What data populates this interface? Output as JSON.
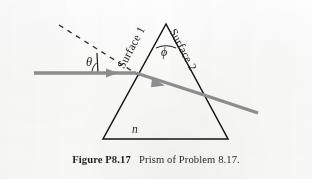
{
  "figure": {
    "caption_number": "Figure P8.17",
    "caption_text": "Prism of Problem 8.17.",
    "labels": {
      "surface_1": "Surface 1",
      "surface_2": "Surface 2",
      "incidence_angle": "θ",
      "apex_angle": "ϕ",
      "refractive_index": "n"
    },
    "colors": {
      "ray": "#8c8c8c",
      "outline": "#111111",
      "background": "#fbfbfa",
      "text": "#1b1b1b"
    },
    "geometry": {
      "apex": [
        166,
        24
      ],
      "base_left": [
        103,
        139
      ],
      "base_right": [
        228,
        139
      ],
      "incident_ray_start": [
        34,
        73
      ],
      "entry_point": [
        136,
        73
      ],
      "exit_point": [
        207,
        96
      ],
      "exit_ray_end": [
        258,
        113
      ],
      "normal_dash_start": [
        59,
        25
      ],
      "normal_dash_end": [
        140,
        76
      ]
    }
  }
}
